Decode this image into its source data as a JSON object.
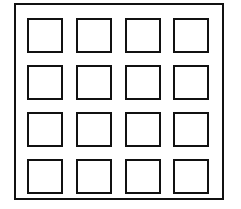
{
  "diagram": {
    "rows": 4,
    "cols": 4,
    "stroke_color": "#111111",
    "background": "#ffffff",
    "cells": [
      {
        "r": 0,
        "c": 0
      },
      {
        "r": 0,
        "c": 1
      },
      {
        "r": 0,
        "c": 2
      },
      {
        "r": 0,
        "c": 3
      },
      {
        "r": 1,
        "c": 0
      },
      {
        "r": 1,
        "c": 1
      },
      {
        "r": 1,
        "c": 2
      },
      {
        "r": 1,
        "c": 3
      },
      {
        "r": 2,
        "c": 0
      },
      {
        "r": 2,
        "c": 1
      },
      {
        "r": 2,
        "c": 2
      },
      {
        "r": 2,
        "c": 3
      },
      {
        "r": 3,
        "c": 0
      },
      {
        "r": 3,
        "c": 1
      },
      {
        "r": 3,
        "c": 2
      },
      {
        "r": 3,
        "c": 3
      }
    ]
  }
}
